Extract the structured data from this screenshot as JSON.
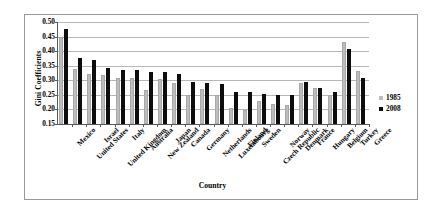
{
  "chart_data": {
    "type": "bar",
    "title": "",
    "xlabel": "Country",
    "ylabel": "Gini Coefficients",
    "ylim": [
      0.15,
      0.5
    ],
    "ytick_step": 0.05,
    "yticks": [
      "0.50",
      "0.45",
      "0.40",
      "0.35",
      "0.30",
      "0.25",
      "0.20",
      "0.15"
    ],
    "grid": true,
    "legend_position": "right",
    "categories": [
      "Mexico",
      "United States",
      "Israel",
      "United Kingdom",
      "Italy",
      "Australia",
      "New Zealand",
      "Japan",
      "Canada",
      "Germany",
      "Netherlands",
      "Luxembourg",
      "Finland",
      "Sweden",
      "Czech Republic",
      "Norway",
      "Denmark",
      "France",
      "Hungary",
      "Belgium",
      "Turkey",
      "Greece"
    ],
    "series": [
      {
        "name": "1985",
        "color": "#bdbdbd",
        "values": [
          0.45,
          0.338,
          0.323,
          0.317,
          0.309,
          0.308,
          0.268,
          0.303,
          0.291,
          0.249,
          0.269,
          0.249,
          0.206,
          0.198,
          0.229,
          0.218,
          0.214,
          0.292,
          0.273,
          0.251,
          0.432,
          0.332
        ]
      },
      {
        "name": "2008",
        "color": "#0d0d0d",
        "values": [
          0.475,
          0.378,
          0.369,
          0.342,
          0.335,
          0.334,
          0.328,
          0.327,
          0.322,
          0.295,
          0.292,
          0.287,
          0.259,
          0.259,
          0.254,
          0.25,
          0.248,
          0.293,
          0.272,
          0.259,
          0.409,
          0.307
        ]
      }
    ]
  },
  "legend": {
    "entries": [
      {
        "label": "1985",
        "color": "#bdbdbd"
      },
      {
        "label": "2008",
        "color": "#0d0d0d"
      }
    ]
  }
}
